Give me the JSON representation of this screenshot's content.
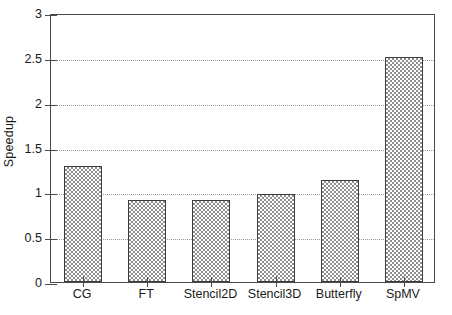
{
  "chart_data": {
    "type": "bar",
    "title": "",
    "xlabel": "",
    "ylabel": "Speedup",
    "categories": [
      "CG",
      "FT",
      "Stencil2D",
      "Stencil3D",
      "Butterfly",
      "SpMV"
    ],
    "values": [
      1.29,
      0.92,
      0.92,
      0.98,
      1.14,
      2.51
    ],
    "ylim": [
      0,
      3
    ],
    "ytick_labels": [
      "0",
      "0.5",
      "1",
      "1.5",
      "2",
      "2.5",
      "3"
    ],
    "ytick_values": [
      0,
      0.5,
      1,
      1.5,
      2,
      2.5,
      3
    ],
    "grid": "horizontal-dotted",
    "legend": "none",
    "bar_fill": "checkerboard-gray",
    "bar_edge_color": "#3d3d3d",
    "bar_fill_color": "#8e8e8e",
    "axis_color": "#4a4a4a",
    "grid_color": "#9a9a9a",
    "background": "#ffffff"
  }
}
